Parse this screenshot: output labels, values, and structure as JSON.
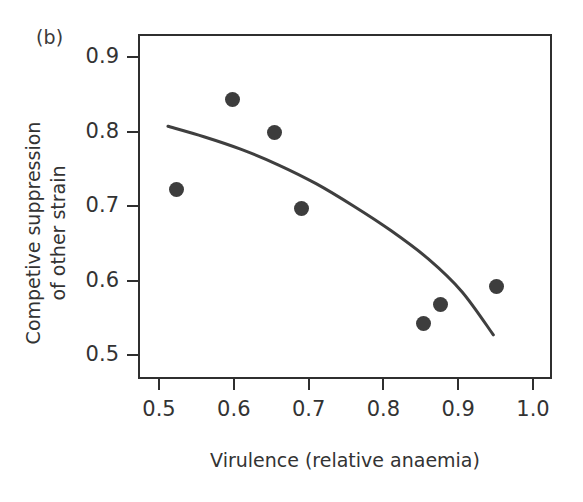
{
  "panel": {
    "label": "(b)"
  },
  "chart_data": {
    "type": "scatter",
    "title": "",
    "subtitle": "",
    "xlabel": "Virulence (relative anaemia)",
    "ylabel": "Competive suppression\nof other strain",
    "xlim": [
      0.47,
      1.025
    ],
    "ylim": [
      0.468,
      0.932
    ],
    "xticks": [
      0.5,
      0.6,
      0.7,
      0.8,
      0.9,
      1.0
    ],
    "xtick_labels": [
      "0.5",
      "0.6",
      "0.7",
      "0.8",
      "0.9",
      "1.0"
    ],
    "yticks": [
      0.5,
      0.6,
      0.7,
      0.8,
      0.9
    ],
    "ytick_labels": [
      "0.5",
      "0.6",
      "0.7",
      "0.8",
      "0.9"
    ],
    "grid": false,
    "legend": false,
    "legend_position": "none",
    "frame": "box",
    "tick_direction": "out",
    "marker": "filled-circle",
    "marker_color": "#3d3d3d",
    "marker_size_px": 15,
    "line_color": "#3f3f3f",
    "line_width_px": 3,
    "series": [
      {
        "name": "observations",
        "type": "scatter",
        "points": [
          {
            "x": 0.524,
            "y": 0.722
          },
          {
            "x": 0.598,
            "y": 0.843
          },
          {
            "x": 0.654,
            "y": 0.799
          },
          {
            "x": 0.69,
            "y": 0.696
          },
          {
            "x": 0.853,
            "y": 0.542
          },
          {
            "x": 0.877,
            "y": 0.568
          },
          {
            "x": 0.951,
            "y": 0.592
          }
        ]
      },
      {
        "name": "fitted-curve",
        "type": "line",
        "points": [
          {
            "x": 0.512,
            "y": 0.807
          },
          {
            "x": 0.56,
            "y": 0.793
          },
          {
            "x": 0.61,
            "y": 0.776
          },
          {
            "x": 0.66,
            "y": 0.755
          },
          {
            "x": 0.71,
            "y": 0.73
          },
          {
            "x": 0.76,
            "y": 0.7
          },
          {
            "x": 0.81,
            "y": 0.667
          },
          {
            "x": 0.86,
            "y": 0.629
          },
          {
            "x": 0.905,
            "y": 0.585
          },
          {
            "x": 0.947,
            "y": 0.527
          }
        ]
      }
    ]
  }
}
